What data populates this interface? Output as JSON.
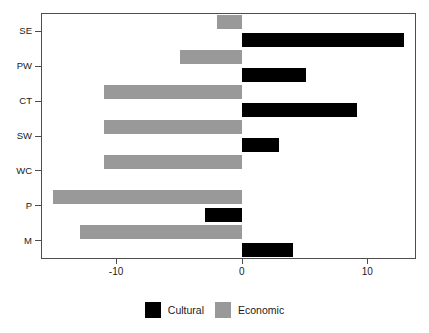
{
  "chart_data": {
    "type": "bar",
    "orientation": "horizontal",
    "title": "",
    "xlabel": "",
    "ylabel": "",
    "categories": [
      "SE",
      "PW",
      "CT",
      "SW",
      "WC",
      "P",
      "M"
    ],
    "series": [
      {
        "name": "Cultural",
        "color": "#000000",
        "values": [
          12.9,
          5.1,
          9.2,
          3.0,
          0.0,
          -2.9,
          4.1
        ]
      },
      {
        "name": "Economic",
        "color": "#999999",
        "values": [
          -2.0,
          -4.9,
          -11.0,
          -11.0,
          -11.0,
          -15.0,
          -12.9
        ]
      }
    ],
    "xlim": [
      -15.9,
      13.8
    ],
    "xticks": [
      -10,
      0,
      10
    ],
    "xtick_labels": [
      "-10",
      "0",
      "10"
    ],
    "grid": false,
    "legend_position": "bottom",
    "legend": [
      "Cultural",
      "Economic"
    ]
  },
  "axes": {
    "x_tick_labels": [
      "-10",
      "0",
      "10"
    ],
    "y_tick_labels": [
      "SE",
      "PW",
      "CT",
      "SW",
      "WC",
      "P",
      "M"
    ]
  },
  "legend": {
    "items": [
      {
        "label": "Cultural",
        "color": "#000000"
      },
      {
        "label": "Economic",
        "color": "#999999"
      }
    ]
  }
}
